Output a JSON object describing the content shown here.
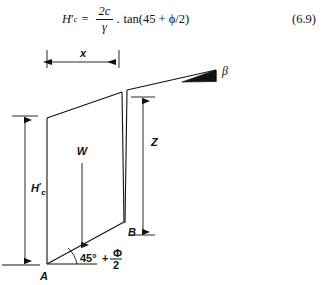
{
  "equation": {
    "lhs_var": "H",
    "lhs_prime": "′",
    "lhs_sub": "c",
    "equals": "=",
    "numerator": "2c",
    "denominator": "γ",
    "operator": ".",
    "rhs": "tan(45 + ϕ/2)",
    "number": "(6.9)",
    "full_text": "H′c = 2c/γ . tan(45 + ϕ/2)"
  },
  "figure": {
    "labels": {
      "x_dimension": "x",
      "z_dimension": "Z",
      "height_var": "H",
      "height_prime": "′",
      "height_sub": "c",
      "weight": "W",
      "point_a": "A",
      "point_b": "B",
      "beta_angle": "β",
      "failure_angle_base": "45°",
      "failure_angle_plus": "+",
      "failure_angle_num": "Φ",
      "failure_angle_den": "2"
    },
    "colors": {
      "line": "#111111",
      "background": "#ffffff"
    },
    "geometry": {
      "point_a": [
        47,
        222
      ],
      "point_b": [
        124,
        180
      ],
      "wedge_top_left": [
        47,
        76
      ],
      "wedge_top_right": [
        122,
        50
      ],
      "crack_top": [
        127,
        48
      ],
      "slope_end": [
        215,
        30
      ],
      "ground_line_y": 223
    }
  }
}
